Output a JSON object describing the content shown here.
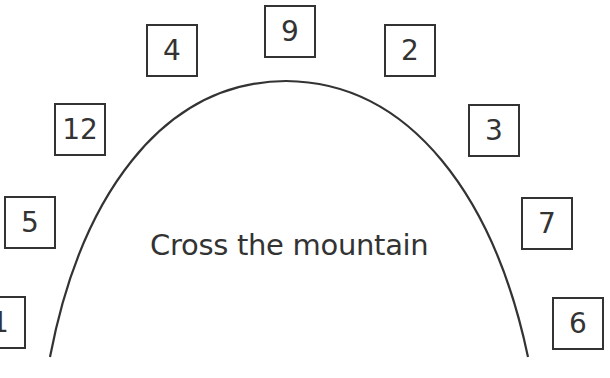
{
  "title": "Cross the mountain",
  "colors": {
    "stroke": "#333333",
    "background": "#ffffff"
  },
  "numbers": [
    {
      "label": "1",
      "left": -26,
      "top": 296
    },
    {
      "label": "5",
      "left": 4,
      "top": 196
    },
    {
      "label": "12",
      "left": 54,
      "top": 103
    },
    {
      "label": "4",
      "left": 146,
      "top": 24
    },
    {
      "label": "9",
      "left": 264,
      "top": 5
    },
    {
      "label": "2",
      "left": 384,
      "top": 24
    },
    {
      "label": "3",
      "left": 468,
      "top": 104
    },
    {
      "label": "7",
      "left": 521,
      "top": 197
    },
    {
      "label": "6",
      "left": 552,
      "top": 297
    }
  ]
}
